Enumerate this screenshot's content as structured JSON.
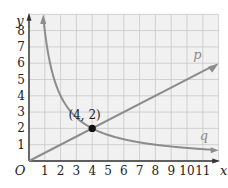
{
  "chart_data": {
    "type": "line",
    "title": "",
    "xlabel": "x",
    "ylabel": "y",
    "origin_label": "O",
    "xlim": [
      0,
      12
    ],
    "ylim": [
      0,
      9
    ],
    "grid": true,
    "x_ticks": [
      "1",
      "2",
      "3",
      "4",
      "5",
      "6",
      "7",
      "8",
      "9",
      "10",
      "11"
    ],
    "y_ticks": [
      "1",
      "2",
      "3",
      "4",
      "5",
      "6",
      "7",
      "8"
    ],
    "series": [
      {
        "name": "p",
        "equation": "y = x/2",
        "points": [
          [
            0,
            0
          ],
          [
            4,
            2
          ],
          [
            8,
            4
          ],
          [
            11.8,
            5.9
          ]
        ],
        "color": "#8c8c8c"
      },
      {
        "name": "q",
        "equation": "y = 8/x",
        "points": [
          [
            1,
            8
          ],
          [
            2,
            4
          ],
          [
            4,
            2
          ],
          [
            8,
            1
          ],
          [
            11.8,
            0.68
          ]
        ],
        "color": "#8c8c8c"
      }
    ],
    "annotations": [
      {
        "label": "(4, 2)",
        "x": 4,
        "y": 2,
        "marker": "filled-circle"
      }
    ]
  },
  "colors": {
    "grid_bg": "#f1f1f1",
    "grid_line": "#c8c8c8",
    "axis": "#333333",
    "curve": "#8c8c8c",
    "point": "#111111"
  }
}
